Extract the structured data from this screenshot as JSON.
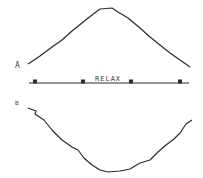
{
  "chart_data": {
    "type": "line",
    "title": "",
    "xlabel": "",
    "ylabel": "",
    "grid": false,
    "legend": null,
    "annotations": [
      "A",
      "B",
      "RELAX"
    ],
    "baseline": {
      "label": "RELAX",
      "y": 83,
      "x_start": 29,
      "x_end": 189,
      "markers_x": [
        35,
        83,
        131,
        180
      ]
    },
    "series": [
      {
        "name": "A",
        "shape": "inverted-U (rise then fall)",
        "points": [
          [
            28,
            64
          ],
          [
            40,
            56
          ],
          [
            52,
            47
          ],
          [
            62,
            40
          ],
          [
            72,
            31
          ],
          [
            82,
            23
          ],
          [
            92,
            15
          ],
          [
            100,
            9
          ],
          [
            112,
            8
          ],
          [
            118,
            12
          ],
          [
            128,
            18
          ],
          [
            140,
            28
          ],
          [
            150,
            37
          ],
          [
            160,
            45
          ],
          [
            170,
            53
          ],
          [
            180,
            60
          ],
          [
            190,
            67
          ]
        ]
      },
      {
        "name": "B",
        "shape": "U (fall then rise)",
        "points": [
          [
            28,
            108
          ],
          [
            36,
            111
          ],
          [
            35,
            114
          ],
          [
            44,
            120
          ],
          [
            52,
            130
          ],
          [
            62,
            140
          ],
          [
            72,
            147
          ],
          [
            78,
            150
          ],
          [
            84,
            158
          ],
          [
            92,
            165
          ],
          [
            100,
            170
          ],
          [
            108,
            172
          ],
          [
            120,
            171
          ],
          [
            130,
            169
          ],
          [
            140,
            163
          ],
          [
            150,
            160
          ],
          [
            158,
            152
          ],
          [
            166,
            145
          ],
          [
            174,
            139
          ],
          [
            180,
            133
          ],
          [
            186,
            124
          ],
          [
            192,
            120
          ]
        ]
      }
    ]
  },
  "labels": {
    "a": "A",
    "b": "B",
    "relax": "RELAX"
  },
  "colors": {
    "line": "#2a2a2a",
    "background": "#ffffff"
  }
}
